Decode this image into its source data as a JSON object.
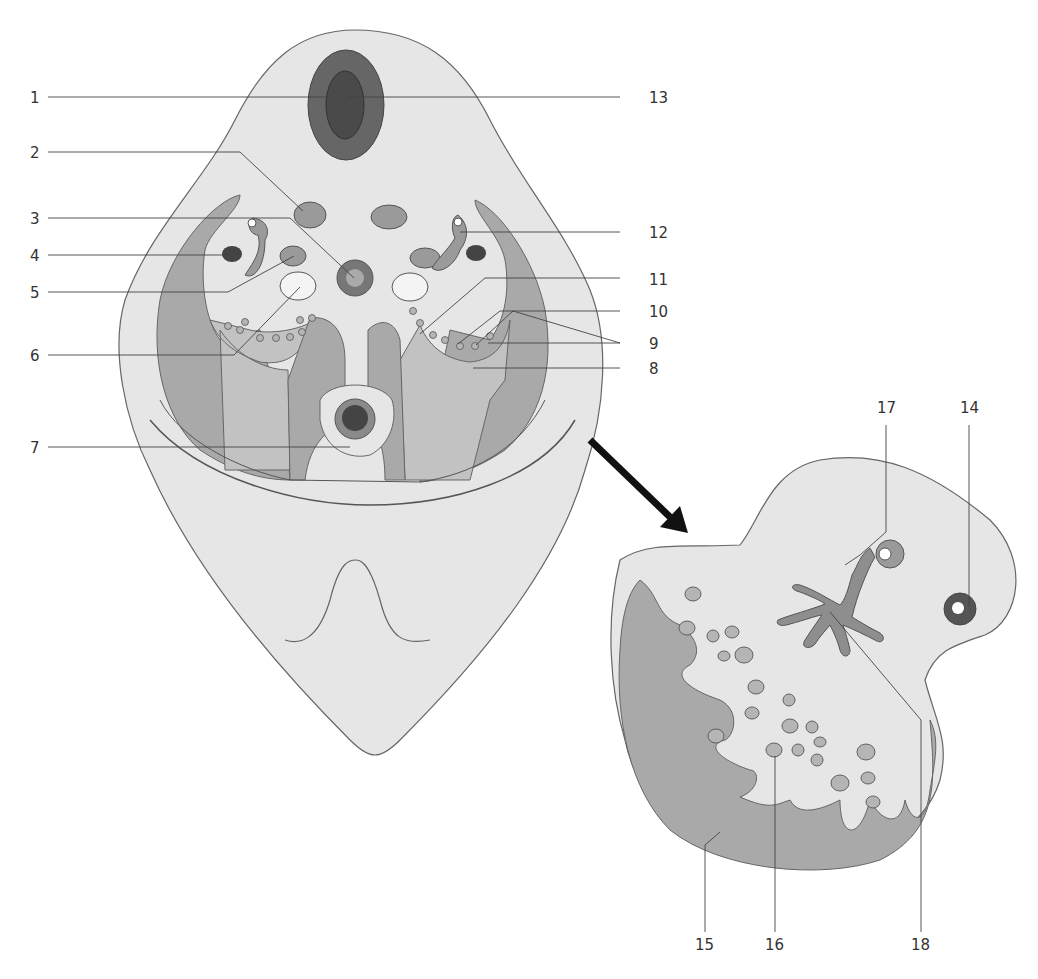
{
  "figure": {
    "type": "anatomical cross-section diagram",
    "main_view": "cross-section of body region (left), with enlarged detail (right)",
    "detail_arrow": "arrow pointing from main section to magnified detail"
  },
  "colors": {
    "skin": "#e6e6e6",
    "muscle": "#a9a9a9",
    "mid_tissue": "#c2c2c2",
    "dark_structure": "#5a5a5a",
    "outline": "#555555"
  },
  "labels": {
    "l1": "1",
    "l2": "2",
    "l3": "3",
    "l4": "4",
    "l5": "5",
    "l6": "6",
    "l7": "7",
    "l8": "8",
    "l9": "9",
    "l10": "10",
    "l11": "11",
    "l12": "12",
    "l13": "13",
    "l14": "14",
    "l15": "15",
    "l16": "16",
    "l17": "17",
    "l18": "18"
  }
}
